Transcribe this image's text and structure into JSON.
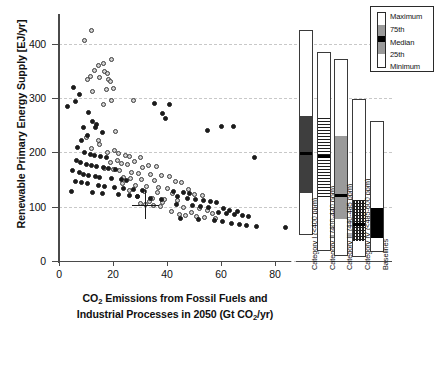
{
  "chart_data": {
    "type": "scatter",
    "title": "",
    "xlabel_line1": "CO2 Emissions from Fossil Fuels and",
    "xlabel_line2": "Industrial Processes in 2050 (Gt CO2/yr)",
    "ylabel": "Renewable Primary Energy Supply [EJ/yr]",
    "xlim": [
      -3,
      88
    ],
    "ylim": [
      0,
      440
    ],
    "xticks": [
      0,
      20,
      40,
      60,
      80
    ],
    "yticks": [
      0,
      100,
      200,
      300,
      400
    ],
    "grid": true,
    "legend_position": "top-right",
    "series": [
      {
        "name": "mitigation-scenarios-open",
        "marker": "open-circle",
        "points": [
          [
            12.0,
            424
          ],
          [
            9.5,
            406
          ],
          [
            19.5,
            372
          ],
          [
            16.5,
            364
          ],
          [
            14.5,
            360
          ],
          [
            13.0,
            352
          ],
          [
            17.0,
            350
          ],
          [
            18.0,
            346
          ],
          [
            11.5,
            340
          ],
          [
            15.0,
            338
          ],
          [
            18.5,
            334
          ],
          [
            10.5,
            334
          ],
          [
            19.0,
            330
          ],
          [
            20.0,
            318
          ],
          [
            17.5,
            316
          ],
          [
            12.5,
            312
          ],
          [
            19.5,
            296
          ],
          [
            27.5,
            296
          ],
          [
            16.5,
            288
          ],
          [
            21.0,
            238
          ],
          [
            10.0,
            228
          ],
          [
            14.5,
            222
          ],
          [
            15.0,
            214
          ],
          [
            12.0,
            208
          ],
          [
            20.5,
            204
          ],
          [
            18.0,
            200
          ],
          [
            22.0,
            198
          ],
          [
            24.5,
            194
          ],
          [
            26.0,
            192
          ],
          [
            30.0,
            190
          ],
          [
            21.5,
            186
          ],
          [
            28.0,
            184
          ],
          [
            19.0,
            182
          ],
          [
            23.0,
            180
          ],
          [
            25.5,
            178
          ],
          [
            33.0,
            176
          ],
          [
            36.0,
            174
          ],
          [
            31.0,
            172
          ],
          [
            17.0,
            170
          ],
          [
            20.0,
            168
          ],
          [
            22.5,
            166
          ],
          [
            27.0,
            164
          ],
          [
            29.5,
            162
          ],
          [
            34.0,
            160
          ],
          [
            38.0,
            158
          ],
          [
            41.0,
            156
          ],
          [
            24.0,
            154
          ],
          [
            26.5,
            152
          ],
          [
            30.5,
            150
          ],
          [
            35.5,
            148
          ],
          [
            43.0,
            146
          ],
          [
            45.5,
            144
          ],
          [
            23.5,
            142
          ],
          [
            28.5,
            140
          ],
          [
            32.5,
            138
          ],
          [
            37.0,
            136
          ],
          [
            40.0,
            134
          ],
          [
            48.0,
            132
          ],
          [
            26.0,
            130
          ],
          [
            31.5,
            128
          ],
          [
            36.5,
            126
          ],
          [
            42.0,
            124
          ],
          [
            50.0,
            122
          ],
          [
            53.0,
            120
          ],
          [
            29.0,
            118
          ],
          [
            34.5,
            116
          ],
          [
            39.0,
            114
          ],
          [
            44.0,
            112
          ],
          [
            33.5,
            110
          ],
          [
            38.5,
            108
          ],
          [
            30.0,
            106
          ],
          [
            32.0,
            104
          ],
          [
            35.0,
            102
          ],
          [
            37.5,
            100
          ],
          [
            46.0,
            98
          ],
          [
            52.0,
            96
          ],
          [
            55.0,
            94
          ],
          [
            41.5,
            92
          ],
          [
            49.0,
            90
          ],
          [
            57.0,
            88
          ],
          [
            44.5,
            86
          ],
          [
            47.0,
            84
          ],
          [
            51.0,
            82
          ],
          [
            54.0,
            80
          ],
          [
            58.0,
            78
          ]
        ]
      },
      {
        "name": "mitigation-scenarios-filled",
        "marker": "filled-circle",
        "points": [
          [
            3.0,
            284
          ],
          [
            5.5,
            320
          ],
          [
            7.5,
            306
          ],
          [
            6.0,
            294
          ],
          [
            11.0,
            274
          ],
          [
            12.5,
            258
          ],
          [
            14.0,
            252
          ],
          [
            9.0,
            246
          ],
          [
            8.5,
            222
          ],
          [
            10.5,
            232
          ],
          [
            35.5,
            290
          ],
          [
            41.0,
            288
          ],
          [
            38.5,
            272
          ],
          [
            39.5,
            262
          ],
          [
            55.0,
            240
          ],
          [
            60.0,
            248
          ],
          [
            64.5,
            248
          ],
          [
            72.5,
            190
          ],
          [
            13.5,
            246
          ],
          [
            16.0,
            236
          ],
          [
            7.0,
            210
          ],
          [
            9.5,
            200
          ],
          [
            11.5,
            196
          ],
          [
            13.0,
            194
          ],
          [
            15.5,
            192
          ],
          [
            17.5,
            190
          ],
          [
            6.5,
            186
          ],
          [
            8.0,
            182
          ],
          [
            10.0,
            178
          ],
          [
            12.0,
            176
          ],
          [
            14.0,
            174
          ],
          [
            16.5,
            172
          ],
          [
            18.5,
            170
          ],
          [
            21.0,
            168
          ],
          [
            5.0,
            166
          ],
          [
            7.5,
            164
          ],
          [
            9.0,
            160
          ],
          [
            11.0,
            158
          ],
          [
            13.5,
            156
          ],
          [
            15.0,
            154
          ],
          [
            19.5,
            152
          ],
          [
            23.0,
            150
          ],
          [
            25.0,
            148
          ],
          [
            6.0,
            146
          ],
          [
            8.5,
            144
          ],
          [
            10.5,
            142
          ],
          [
            14.5,
            140
          ],
          [
            17.0,
            138
          ],
          [
            20.5,
            136
          ],
          [
            24.0,
            134
          ],
          [
            27.5,
            132
          ],
          [
            31.0,
            130
          ],
          [
            4.5,
            128
          ],
          [
            12.5,
            126
          ],
          [
            16.0,
            124
          ],
          [
            22.0,
            122
          ],
          [
            26.0,
            120
          ],
          [
            29.0,
            118
          ],
          [
            34.0,
            116
          ],
          [
            38.0,
            114
          ],
          [
            42.5,
            128
          ],
          [
            46.0,
            126
          ],
          [
            48.5,
            124
          ],
          [
            44.0,
            118
          ],
          [
            47.5,
            116
          ],
          [
            50.5,
            114
          ],
          [
            53.5,
            112
          ],
          [
            56.0,
            110
          ],
          [
            58.5,
            108
          ],
          [
            43.5,
            104
          ],
          [
            49.5,
            102
          ],
          [
            52.5,
            100
          ],
          [
            55.5,
            98
          ],
          [
            61.0,
            96
          ],
          [
            63.0,
            94
          ],
          [
            66.0,
            92
          ],
          [
            59.0,
            90
          ],
          [
            62.0,
            88
          ],
          [
            65.0,
            86
          ],
          [
            68.0,
            84
          ],
          [
            70.0,
            82
          ],
          [
            45.0,
            78
          ],
          [
            51.5,
            76
          ],
          [
            57.5,
            74
          ],
          [
            60.5,
            72
          ],
          [
            64.0,
            70
          ],
          [
            67.0,
            68
          ],
          [
            69.5,
            66
          ],
          [
            73.0,
            64
          ],
          [
            84.0,
            62
          ]
        ]
      }
    ],
    "error_marker": {
      "name": "cross-marker",
      "x": 32.0,
      "y": 104,
      "xerr": 5.0,
      "yerr": 26
    },
    "boxplot": {
      "ylabel_shared": true,
      "legend": {
        "items": [
          {
            "key": "maximum",
            "label": "Maximum"
          },
          {
            "key": "p75",
            "label": "75th"
          },
          {
            "key": "median",
            "label": "Median"
          },
          {
            "key": "p25",
            "label": "25th"
          },
          {
            "key": "minimum",
            "label": "Minimum"
          }
        ]
      },
      "boxes": [
        {
          "label": "Category I (<400 ppm)",
          "fill": "darkgray",
          "minimum": 48,
          "p25": 126,
          "median": 198,
          "p75": 268,
          "maximum": 425
        },
        {
          "label": "Category II (400-440 ppm)",
          "fill": "stripes",
          "minimum": 18,
          "p25": 118,
          "median": 193,
          "p75": 263,
          "maximum": 385
        },
        {
          "label": "Category III (440-485 ppm)",
          "fill": "medgray",
          "minimum": 10,
          "p25": 78,
          "median": 120,
          "p75": 230,
          "maximum": 372
        },
        {
          "label": "Category IV (<485-600 ppm)",
          "fill": "checker",
          "minimum": 8,
          "p25": 36,
          "median": 68,
          "p75": 112,
          "maximum": 298
        },
        {
          "label": "Baselines",
          "fill": "black",
          "minimum": 16,
          "p25": 43,
          "median": 76,
          "p75": 98,
          "maximum": 258
        }
      ]
    }
  }
}
